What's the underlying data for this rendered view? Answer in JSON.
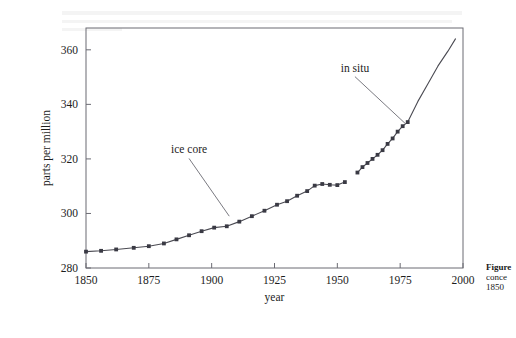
{
  "figure": {
    "frame": {
      "x": 86,
      "y": 28,
      "width": 377,
      "height": 240
    },
    "caption_lines": [
      "Figure",
      "conce",
      "1850"
    ]
  },
  "chart_data": {
    "type": "line",
    "title": "",
    "subtitle": "",
    "xlabel": "year",
    "ylabel": "parts per million",
    "xlim": [
      1850,
      2000
    ],
    "ylim": [
      280,
      368
    ],
    "xticks": [
      1850,
      1875,
      1900,
      1925,
      1950,
      1975,
      2000
    ],
    "xtick_labels": [
      "1850",
      "1875",
      "1900",
      "1925",
      "1950",
      "1975",
      "2000"
    ],
    "yticks": [
      280,
      300,
      320,
      340,
      360
    ],
    "ytick_labels": [
      "280",
      "300",
      "320",
      "340",
      "360"
    ],
    "grid": false,
    "legend": "none",
    "line_color": "#4a4a52",
    "marker_color": "#3a3a44",
    "marker_shape": "square",
    "annotations": [
      {
        "text": "ice core",
        "label_x": 1891,
        "label_y": 322,
        "leader_to_x": 1907,
        "leader_to_y": 299
      },
      {
        "text": "in situ",
        "label_x": 1957,
        "label_y": 352,
        "leader_to_x": 1977,
        "leader_to_y": 333
      }
    ],
    "series": [
      {
        "name": "ice core",
        "markers": true,
        "x": [
          1850,
          1856,
          1862,
          1869,
          1875,
          1881,
          1886,
          1891,
          1896,
          1901,
          1906,
          1911,
          1916,
          1921,
          1926,
          1930,
          1934,
          1938,
          1941,
          1944,
          1947,
          1950,
          1953
        ],
        "y": [
          286.0,
          286.3,
          286.8,
          287.4,
          288.0,
          289.0,
          290.5,
          292.0,
          293.5,
          294.8,
          295.3,
          297.0,
          299.0,
          301.0,
          303.2,
          304.5,
          306.5,
          308.2,
          310.2,
          310.8,
          310.5,
          310.4,
          311.5
        ]
      },
      {
        "name": "in situ",
        "markers": true,
        "x": [
          1958,
          1960,
          1962,
          1964,
          1966,
          1968,
          1970,
          1972,
          1974,
          1976,
          1978
        ],
        "y": [
          315.0,
          317.0,
          318.5,
          320.0,
          321.5,
          323.2,
          325.5,
          327.5,
          330.0,
          332.0,
          333.5
        ]
      },
      {
        "name": "in situ continued",
        "markers": false,
        "x": [
          1978,
          1982,
          1986,
          1990,
          1994,
          1997
        ],
        "y": [
          333.5,
          341.0,
          347.5,
          354.0,
          359.5,
          364.0
        ]
      }
    ]
  }
}
